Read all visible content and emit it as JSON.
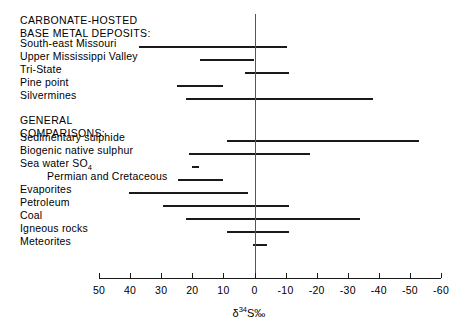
{
  "chart_data": {
    "type": "bar",
    "orientation": "horizontal-range",
    "title": "",
    "xlabel": "δ 34 S‰",
    "ylabel": "",
    "xlim": [
      50,
      -60
    ],
    "grid": false,
    "legend": null,
    "axis": {
      "tick_labels": [
        "50",
        "40",
        "30",
        "20",
        "10",
        "0",
        "-10",
        "-20",
        "-30",
        "-40",
        "-50",
        "-60"
      ],
      "tick_values": [
        50,
        40,
        30,
        20,
        10,
        0,
        -10,
        -20,
        -30,
        -40,
        -50,
        -60
      ],
      "zero_value": 0
    },
    "group_headings": [
      {
        "line1": "CARBONATE-HOSTED",
        "line2": "BASE METAL DEPOSITS:"
      },
      {
        "line1": "GENERAL",
        "line2": "COMPARISONS:"
      }
    ],
    "categories": [
      "South-east Missouri",
      "Upper Mississippi Valley",
      "Tri-State",
      "Pine point",
      "Silvermines",
      "Sedimentary sulphide",
      "Biogenic native sulphur",
      "Sea water SO4",
      "Permian and Cretaceous",
      "Evaporites",
      "Petroleum",
      "Coal",
      "Igneous rocks",
      "Meteorites"
    ],
    "ranges": [
      {
        "label": "South-east Missouri",
        "min": -10.5,
        "max": 37.0
      },
      {
        "label": "Upper Mississippi Valley",
        "min": 0.0,
        "max": 17.5
      },
      {
        "label": "Tri-State",
        "min": -11.0,
        "max": 3.0
      },
      {
        "label": "Pine point",
        "min": 10.0,
        "max": 25.0
      },
      {
        "label": "Silvermines",
        "min": -38.0,
        "max": 22.0
      },
      {
        "label": "Sedimentary sulphide",
        "min": -53.0,
        "max": 9.0
      },
      {
        "label": "Biogenic native sulphur",
        "min": -18.0,
        "max": 21.0
      },
      {
        "label": "Sea water SO4",
        "min": 18.0,
        "max": 20.0
      },
      {
        "label": "Permian and Cretaceous",
        "min": 10.0,
        "max": 24.5
      },
      {
        "label": "Evaporites",
        "min": 2.0,
        "max": 40.5
      },
      {
        "label": "Petroleum",
        "min": -11.0,
        "max": 29.5
      },
      {
        "label": "Coal",
        "min": -34.0,
        "max": 22.0
      },
      {
        "label": "Igneous rocks",
        "min": -11.0,
        "max": 9.0
      },
      {
        "label": "Meteorites",
        "min": -4.0,
        "max": 0.5
      }
    ]
  },
  "labels": {
    "heading_1_line_1": "CARBONATE-HOSTED",
    "heading_1_line_2": "BASE METAL DEPOSITS:",
    "heading_2_line_1": "GENERAL",
    "heading_2_line_2": "COMPARISONS:",
    "rows": [
      {
        "text": "South-east Missouri",
        "indent": false
      },
      {
        "text": "Upper Mississippi Valley",
        "indent": false
      },
      {
        "text": "Tri-State",
        "indent": false
      },
      {
        "text": "Pine point",
        "indent": false
      },
      {
        "text": "Silvermines",
        "indent": false
      },
      {
        "text": "Sedimentary sulphide",
        "indent": false
      },
      {
        "text": "Biogenic native sulphur",
        "indent": false
      },
      {
        "text": "Sea water SO",
        "indent": false,
        "subscript": "4"
      },
      {
        "text": "Permian and Cretaceous",
        "indent": true
      },
      {
        "text": "Evaporites",
        "indent": false
      },
      {
        "text": "Petroleum",
        "indent": false
      },
      {
        "text": "Coal",
        "indent": false
      },
      {
        "text": "Igneous rocks",
        "indent": false
      },
      {
        "text": "Meteorites",
        "indent": false
      }
    ]
  },
  "axis_title": {
    "delta": "δ",
    "mass": "34",
    "element": "S‰"
  },
  "colors": {
    "background": "#ffffff",
    "ink": "#1a1a1a",
    "zero_line": "#555555"
  },
  "geometry": {
    "plot_left_px": 99,
    "plot_right_px": 441,
    "zero_px": 254.5,
    "px_per_unit": 3.109,
    "axis_y_px": 278,
    "row_start_y_px": 46,
    "row_step_px": 13.6
  }
}
